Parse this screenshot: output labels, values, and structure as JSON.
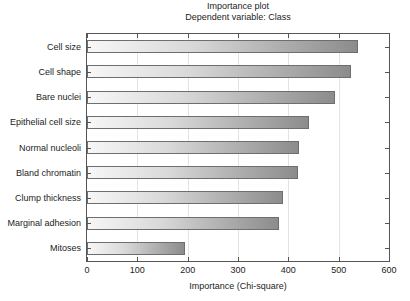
{
  "chart_data": {
    "type": "bar",
    "orientation": "horizontal",
    "title": "Importance plot",
    "subtitle": "Dependent variable: Class",
    "xlabel": "Importance (Chi-square)",
    "ylabel": "",
    "xlim": [
      0,
      600
    ],
    "xticks": [
      0,
      100,
      200,
      300,
      400,
      500,
      600
    ],
    "xtick_labels": [
      "0",
      "100",
      "200",
      "300",
      "400",
      "500",
      "600"
    ],
    "grid": true,
    "legend": null,
    "categories": [
      "Cell size",
      "Cell shape",
      "Bare nuclei",
      "Epithelial cell size",
      "Normal nucleoli",
      "Bland chromatin",
      "Clump thickness",
      "Marginal adhesion",
      "Mitoses"
    ],
    "values": [
      539,
      525,
      493,
      442,
      421,
      419,
      389,
      381,
      195
    ],
    "bar_gradient": {
      "from": "#f7f7f7",
      "to": "#8c8c8c"
    },
    "bar_border_color": "#6e6e6e",
    "axis_color": "#555555",
    "grid_color": "#e3e3e3",
    "background": "#ffffff"
  }
}
